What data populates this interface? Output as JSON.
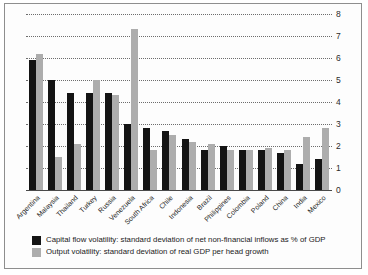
{
  "chart_data": {
    "type": "bar",
    "title": "",
    "xlabel": "",
    "ylabel": "",
    "ylim": [
      0,
      8
    ],
    "yticks": [
      0,
      1,
      2,
      3,
      4,
      5,
      6,
      7,
      8
    ],
    "grid": true,
    "legend_position": "bottom-left",
    "categories": [
      "Argentina",
      "Malaysia",
      "Thailand",
      "Turkey",
      "Russia",
      "Venezuela",
      "South Africa",
      "Chile",
      "Indonesia",
      "Brazil",
      "Philippines",
      "Colombia",
      "Poland",
      "China",
      "India",
      "Mexico"
    ],
    "series": [
      {
        "name": "Capital flow volatility: standard deviation of net non-financial inflows as % of GDP",
        "color": "#141414",
        "values": [
          5.9,
          5.0,
          4.4,
          4.4,
          4.4,
          3.0,
          2.8,
          2.7,
          2.3,
          1.8,
          2.0,
          1.8,
          1.8,
          1.7,
          1.2,
          1.4
        ]
      },
      {
        "name": "Output volatility: standard deviation of real GDP per head growth",
        "color": "#adadad",
        "values": [
          6.2,
          1.5,
          2.1,
          5.0,
          4.3,
          7.3,
          1.8,
          2.5,
          2.2,
          2.1,
          1.8,
          1.8,
          1.9,
          1.8,
          2.4,
          2.8
        ]
      }
    ]
  },
  "legend": {
    "items": [
      {
        "swatch": "black-swatch",
        "label": "Capital flow volatility: standard deviation of net non-financial inflows as % of GDP"
      },
      {
        "swatch": "grey-swatch",
        "label": "Output volatility: standard deviation of real GDP per head growth"
      }
    ]
  },
  "axis": {
    "y_tick_labels": [
      "0",
      "1",
      "2",
      "3",
      "4",
      "5",
      "6",
      "7",
      "8"
    ],
    "x_tick_labels": [
      "Argentina",
      "Malaysia",
      "Thailand",
      "Turkey",
      "Russia",
      "Venezuela",
      "South Africa",
      "Chile",
      "Indonesia",
      "Brazil",
      "Philippines",
      "Colombia",
      "Poland",
      "China",
      "India",
      "Mexico"
    ]
  }
}
